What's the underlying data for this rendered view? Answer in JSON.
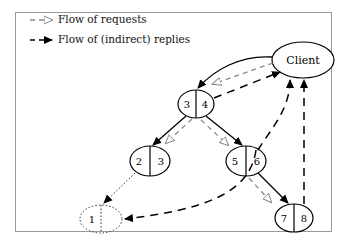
{
  "legend": {
    "items": [
      {
        "label": "Flow of requests",
        "style": "gray dashed, hollow arrowhead",
        "color": "#8a8a8a"
      },
      {
        "label": "Flow of (indirect) replies",
        "style": "black dashed, filled arrowhead",
        "color": "#000000"
      }
    ]
  },
  "nodes": {
    "client": {
      "label": "Client"
    },
    "n34": {
      "left": "3",
      "right": "4"
    },
    "n23": {
      "left": "2",
      "right": "3"
    },
    "n56": {
      "left": "5",
      "right": "6"
    },
    "n78": {
      "left": "7",
      "right": "8"
    },
    "n1": {
      "left": "1",
      "style": "dotted"
    }
  },
  "edges": {
    "solid": [
      "Client→3|4",
      "3|4→2|3",
      "4→5|6",
      "6→7|8"
    ],
    "requests": [
      "Client→3|4",
      "3|4→2|3",
      "3|4→5|6",
      "5|6→7|8"
    ],
    "replies": [
      "3|4→Client",
      "6→1",
      "6→Client",
      "8→Client"
    ],
    "dotted": [
      "2|3→1"
    ]
  },
  "colors": {
    "frame": "#9a9a9a",
    "request": "#8a8a8a",
    "reply": "#000000"
  }
}
